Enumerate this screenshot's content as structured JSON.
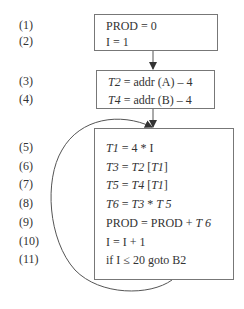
{
  "diagram": {
    "title": "",
    "blocks": [
      {
        "id": "B0",
        "lines": [
          {
            "num": "(1)",
            "code": "PROD = 0"
          },
          {
            "num": "(2)",
            "code": "I = 1"
          }
        ]
      },
      {
        "id": "B1",
        "lines": [
          {
            "num": "(3)",
            "code": "T2 = addr (A) – 4"
          },
          {
            "num": "(4)",
            "code": "T4 = addr (B) – 4"
          }
        ]
      },
      {
        "id": "B2",
        "lines": [
          {
            "num": "(5)",
            "code": "T1 = 4 * I"
          },
          {
            "num": "(6)",
            "code": "T3 = T2 [T1]"
          },
          {
            "num": "(7)",
            "code": "T5 = T4 [T1]"
          },
          {
            "num": "(8)",
            "code": "T6 = T3 * T 5"
          },
          {
            "num": "(9)",
            "code": "PROD = PROD + T 6"
          },
          {
            "num": "(10)",
            "code": "I = I + 1"
          },
          {
            "num": "(11)",
            "code": "if I ≤ 20 goto B2"
          }
        ]
      }
    ],
    "edges": [
      {
        "from": "B0",
        "to": "B1",
        "type": "straight"
      },
      {
        "from": "B1",
        "to": "B2",
        "type": "straight"
      },
      {
        "from": "B2",
        "to": "B2",
        "type": "loop-back"
      }
    ]
  }
}
